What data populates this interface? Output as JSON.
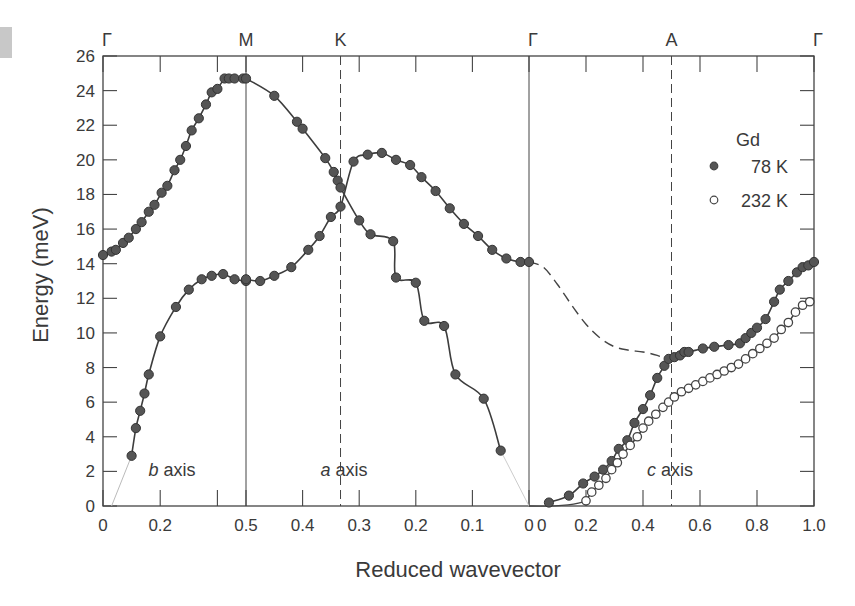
{
  "chart_data": {
    "type": "scatter",
    "title": "",
    "xlabel": "Reduced wavevector",
    "ylabel": "Energy (meV)",
    "ylim": [
      0,
      26
    ],
    "yticks": [
      0,
      2,
      4,
      6,
      8,
      10,
      12,
      14,
      16,
      18,
      20,
      22,
      24,
      26
    ],
    "grid": false,
    "symmetry_points": [
      "Γ",
      "M",
      "K",
      "Γ",
      "A",
      "Γ"
    ],
    "segments": [
      {
        "name": "b axis",
        "path": "Γ→M",
        "q_range": [
          0,
          0.5
        ],
        "tick_labels": [
          "0",
          "0.2",
          "0.5"
        ]
      },
      {
        "name": "a axis",
        "path": "M→K→Γ",
        "q_range": [
          0.5,
          0
        ],
        "tick_labels": [
          "0.5",
          "0.4",
          "0.3",
          "0.2",
          "0.1",
          "0"
        ],
        "K_at": 0.333
      },
      {
        "name": "c axis",
        "path": "Γ→A→Γ",
        "q_range": [
          0,
          1.0
        ],
        "tick_labels": [
          "0",
          "0.2",
          "0.4",
          "0.6",
          "0.8",
          "1.0"
        ],
        "A_at": 0.5
      }
    ],
    "legend": {
      "title": "Gd",
      "position": "upper right",
      "entries": [
        {
          "label": "78 K",
          "marker": "filled"
        },
        {
          "label": "232 K",
          "marker": "open"
        }
      ]
    },
    "series": [
      {
        "name": "78 K",
        "segment": "b axis",
        "branch": "upper",
        "q": [
          0.0,
          0.03,
          0.045,
          0.07,
          0.09,
          0.115,
          0.135,
          0.16,
          0.18,
          0.205,
          0.225,
          0.25,
          0.27,
          0.29,
          0.31,
          0.335,
          0.36,
          0.38,
          0.4,
          0.425,
          0.44,
          0.46,
          0.49
        ],
        "E": [
          14.5,
          14.7,
          14.8,
          15.2,
          15.5,
          16.0,
          16.4,
          17.0,
          17.4,
          18.1,
          18.5,
          19.4,
          20.0,
          20.8,
          21.7,
          22.4,
          23.2,
          23.9,
          24.1,
          24.7,
          24.7,
          24.7,
          24.7
        ]
      },
      {
        "name": "78 K",
        "segment": "b axis",
        "branch": "lower",
        "q": [
          0.1,
          0.115,
          0.13,
          0.145,
          0.16,
          0.2,
          0.255,
          0.3,
          0.345,
          0.38,
          0.42,
          0.46,
          0.5
        ],
        "E": [
          2.9,
          4.5,
          5.5,
          6.5,
          7.6,
          9.8,
          11.5,
          12.5,
          13.1,
          13.3,
          13.4,
          13.1,
          13.0
        ]
      },
      {
        "name": "78 K",
        "segment": "a axis",
        "branch": "descending",
        "q": [
          0.5,
          0.45,
          0.41,
          0.4,
          0.36,
          0.345,
          0.338,
          0.333,
          0.3,
          0.28,
          0.24,
          0.235,
          0.2,
          0.185,
          0.15,
          0.13,
          0.08,
          0.05
        ],
        "E": [
          24.7,
          23.7,
          22.2,
          21.8,
          20.1,
          19.3,
          18.8,
          18.4,
          16.5,
          15.7,
          15.3,
          13.2,
          12.9,
          10.7,
          10.4,
          7.6,
          6.2,
          3.2
        ]
      },
      {
        "name": "78 K",
        "segment": "a axis",
        "branch": "ascending",
        "q": [
          0.5,
          0.475,
          0.45,
          0.42,
          0.39,
          0.37,
          0.35,
          0.333,
          0.31,
          0.285,
          0.26,
          0.235,
          0.21,
          0.19,
          0.165,
          0.14,
          0.115,
          0.09,
          0.065,
          0.04,
          0.015,
          0.0
        ],
        "E": [
          13.1,
          13.0,
          13.3,
          13.8,
          14.8,
          15.6,
          16.7,
          17.3,
          19.9,
          20.3,
          20.4,
          20.0,
          19.7,
          19.0,
          18.2,
          17.2,
          16.3,
          15.6,
          14.8,
          14.3,
          14.1,
          14.1
        ]
      },
      {
        "name": "78 K",
        "segment": "c axis",
        "branch": "acoustic",
        "q": [
          0.07,
          0.14,
          0.19,
          0.23,
          0.26,
          0.29,
          0.315,
          0.345,
          0.37,
          0.4,
          0.425,
          0.45,
          0.475,
          0.49,
          0.51,
          0.53,
          0.545,
          0.56,
          0.61,
          0.65,
          0.7,
          0.74,
          0.76,
          0.78,
          0.8,
          0.83,
          0.86,
          0.88,
          0.91,
          0.94,
          0.96,
          0.98,
          1.0
        ],
        "E": [
          0.2,
          0.6,
          1.3,
          1.7,
          2.1,
          2.6,
          3.3,
          3.8,
          4.8,
          5.6,
          6.4,
          7.4,
          8.1,
          8.5,
          8.6,
          8.7,
          8.9,
          8.9,
          9.1,
          9.2,
          9.3,
          9.4,
          9.7,
          10.0,
          10.3,
          10.8,
          11.8,
          12.5,
          13.0,
          13.5,
          13.8,
          13.9,
          14.1
        ]
      },
      {
        "name": "232 K",
        "segment": "c axis",
        "branch": "acoustic",
        "q": [
          0.2,
          0.22,
          0.245,
          0.27,
          0.29,
          0.31,
          0.33,
          0.355,
          0.38,
          0.4,
          0.42,
          0.445,
          0.47,
          0.49,
          0.51,
          0.535,
          0.56,
          0.585,
          0.61,
          0.635,
          0.66,
          0.685,
          0.71,
          0.735,
          0.76,
          0.785,
          0.81,
          0.835,
          0.86,
          0.885,
          0.91,
          0.935,
          0.96,
          0.985
        ],
        "E": [
          0.3,
          0.8,
          1.2,
          1.6,
          2.1,
          2.5,
          3.0,
          3.5,
          4.0,
          4.5,
          4.9,
          5.3,
          5.7,
          6.0,
          6.3,
          6.6,
          6.8,
          7.0,
          7.2,
          7.4,
          7.6,
          7.8,
          8.0,
          8.2,
          8.5,
          8.8,
          9.1,
          9.4,
          9.7,
          10.2,
          10.6,
          11.2,
          11.6,
          11.8
        ]
      }
    ],
    "curves": [
      {
        "name": "c-axis optic branch (dashed, extrapolated)",
        "style": "dashed",
        "q": [
          0.0,
          0.05,
          0.1,
          0.15,
          0.2,
          0.25,
          0.3,
          0.35,
          0.4,
          0.45,
          0.5
        ],
        "E": [
          14.1,
          13.8,
          12.8,
          11.6,
          10.5,
          9.7,
          9.2,
          9.0,
          8.9,
          8.7,
          8.4
        ]
      }
    ],
    "annotations": [
      {
        "text": "b axis",
        "segment": "b axis"
      },
      {
        "text": "a axis",
        "segment": "a axis"
      },
      {
        "text": "c axis",
        "segment": "c axis"
      }
    ]
  }
}
